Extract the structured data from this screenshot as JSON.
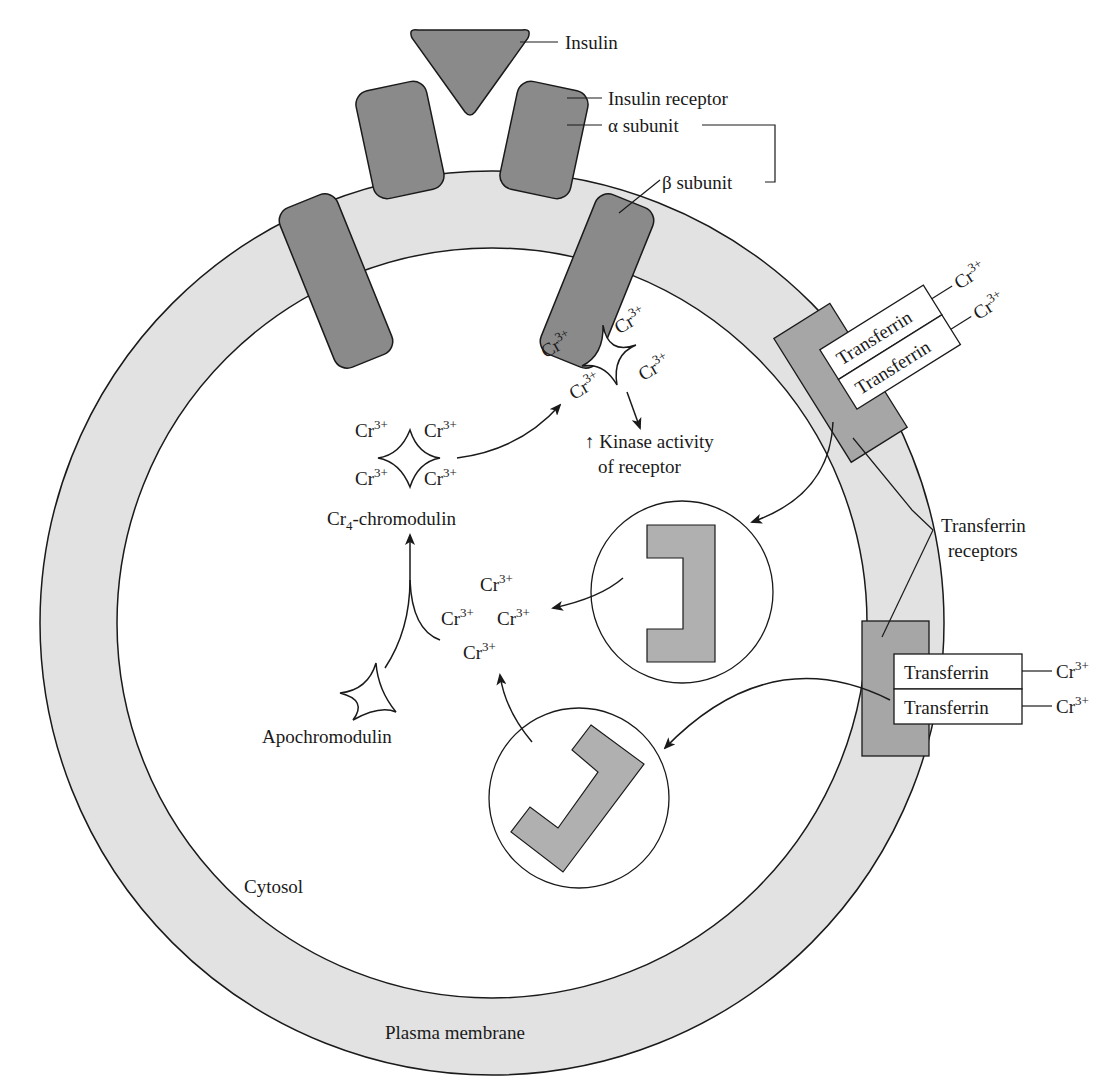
{
  "figure": {
    "labels": {
      "insulin": "Insulin",
      "insulin_receptor": "Insulin receptor",
      "alpha_subunit": "α subunit",
      "beta_subunit": "β subunit",
      "kinase_line1": "↑ Kinase activity",
      "kinase_line2": "of receptor",
      "cr4_prefix": "Cr",
      "cr4_sub": "4",
      "cr4_suffix": "-chromodulin",
      "apochromodulin": "Apochromodulin",
      "transferrin_receptors_line1": "Transferrin",
      "transferrin_receptors_line2": "receptors",
      "cytosol": "Cytosol",
      "plasma_membrane": "Plasma membrane",
      "transferrin": "Transferrin"
    },
    "ion": {
      "base": "Cr",
      "charge": "3+"
    },
    "colors": {
      "membrane_fill": "#e2e2e2",
      "receptor_fill": "#8a8a8a",
      "transferrin_receptor_fill": "#a6a6a6",
      "vesicle_cargo_fill": "#b0b0b0",
      "outline": "#1a1a1a",
      "background": "#ffffff"
    }
  }
}
